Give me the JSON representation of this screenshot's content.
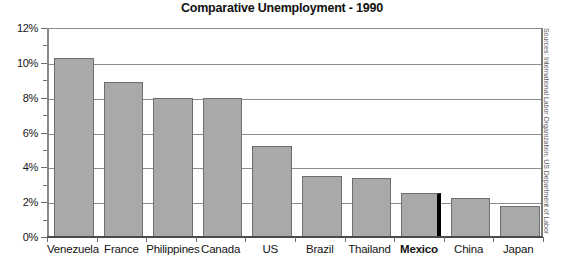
{
  "chart_data": {
    "type": "bar",
    "title": "Comparative Unemployment - 1990",
    "xlabel": "",
    "ylabel": "",
    "ylim": [
      0,
      12
    ],
    "ytick_step": 2,
    "yminor_step": 1,
    "ytick_suffix": "%",
    "grid": true,
    "legend": null,
    "categories": [
      "Venezuela",
      "France",
      "Philippines",
      "Canada",
      "US",
      "Brazil",
      "Thailand",
      "Mexico",
      "China",
      "Japan"
    ],
    "values": [
      10.3,
      8.9,
      8.0,
      8.0,
      5.2,
      3.5,
      3.4,
      2.5,
      2.25,
      1.8
    ],
    "highlight_category": "Mexico",
    "ytick_labels": [
      "0%",
      "2%",
      "4%",
      "6%",
      "8%",
      "10%",
      "12%"
    ],
    "ytick_values": [
      0,
      2,
      4,
      6,
      8,
      10,
      12
    ],
    "annotations": [
      "Sources: International Labor Organization, US Department of Labor"
    ]
  },
  "chart": {
    "source_note": "Sources: International Labor Organization, US Department of Labor"
  },
  "colors": {
    "bar_fill": "#a9a9a9",
    "bar_border": "#6e6e6e",
    "highlight": "#000000",
    "grid": "#8c8c8c",
    "axis": "#4a4a4a",
    "text": "#141414",
    "background": "#ffffff"
  }
}
